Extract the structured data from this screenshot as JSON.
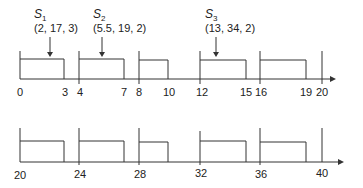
{
  "timeline_top": {
    "ticks": [
      "0",
      "3",
      "4",
      "7",
      "8",
      "10",
      "12",
      "15",
      "16",
      "19",
      "20"
    ],
    "servers": [
      {
        "name": "S",
        "sub": "1",
        "params": "(2, 17, 3)"
      },
      {
        "name": "S",
        "sub": "2",
        "params": "(5.5, 19, 2)"
      },
      {
        "name": "S",
        "sub": "3",
        "params": "(13, 34, 2)"
      }
    ]
  },
  "timeline_bottom": {
    "ticks": [
      "20",
      "24",
      "28",
      "32",
      "36",
      "40"
    ]
  }
}
